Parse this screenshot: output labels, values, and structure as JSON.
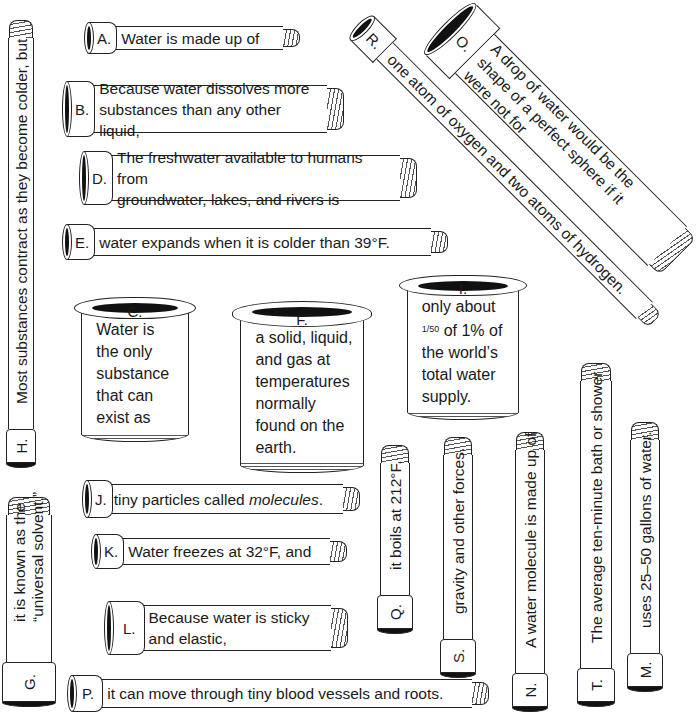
{
  "worksheet": {
    "pipes": {
      "A": {
        "label": "A.",
        "text": "Water is made up of"
      },
      "B": {
        "label": "B.",
        "line1": "Because water dissolves more",
        "line2": "substances than any other liquid,"
      },
      "C": {
        "label": "C.",
        "lines": [
          "Water is",
          "the only",
          "substance",
          "that can",
          "exist as"
        ]
      },
      "D": {
        "label": "D.",
        "line1": "The freshwater available to humans from",
        "line2": "groundwater, lakes, and rivers is"
      },
      "E": {
        "label": "E.",
        "text": "water expands when it is colder than 39°F."
      },
      "F": {
        "label": "F.",
        "lines": [
          "a solid, liquid,",
          "and gas at",
          "temperatures",
          "normally",
          "found on the",
          "earth."
        ]
      },
      "G": {
        "label": "G.",
        "line1": "it is known as the",
        "line2": "“universal solvent.”"
      },
      "H": {
        "label": "H.",
        "text": "Most substances contract as they become colder, but"
      },
      "I": {
        "label": "I.",
        "line1": "only about",
        "fraction": "1/50",
        "line2_rest": " of 1% of",
        "line3": "the world’s",
        "line4": "total water",
        "line5": "supply."
      },
      "J": {
        "label": "J.",
        "text_before": "tiny particles called ",
        "text_em": "molecules",
        "text_after": "."
      },
      "K": {
        "label": "K.",
        "text": "Water freezes at 32°F, and"
      },
      "L": {
        "label": "L.",
        "line1": "Because water is sticky",
        "line2": "and elastic,"
      },
      "M": {
        "label": "M.",
        "text": "uses 25–50 gallons of water."
      },
      "N": {
        "label": "N.",
        "text": "A water molecule is made up of"
      },
      "O": {
        "label": "O.",
        "line1": "A drop of water would be the",
        "line2": "shape of a perfect sphere if it",
        "line3": "were not for"
      },
      "P": {
        "label": "P.",
        "text": "it can move through tiny blood vessels and roots."
      },
      "Q": {
        "label": "Q.",
        "text": "it boils at 212°F."
      },
      "R": {
        "label": "R.",
        "text": "one atom of oxygen and two atoms of hydrogen."
      },
      "S": {
        "label": "S.",
        "text": "gravity and other forces."
      },
      "T": {
        "label": "T.",
        "text": "The average ten-minute bath or shower"
      }
    }
  }
}
